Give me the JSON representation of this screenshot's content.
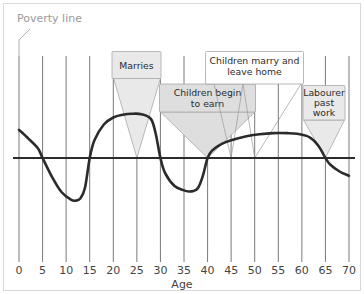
{
  "chart_data": {
    "type": "line",
    "title": "",
    "xlabel": "Age",
    "ylabel": "",
    "xlim": [
      0,
      70
    ],
    "ylim": [
      -1,
      1
    ],
    "grid": true,
    "legend_position": "none",
    "x_ticks": [
      "0",
      "5",
      "10",
      "15",
      "20",
      "25",
      "30",
      "35",
      "40",
      "45",
      "50",
      "55",
      "60",
      "65",
      "70"
    ],
    "x_tick_values": [
      0,
      5,
      10,
      15,
      20,
      25,
      30,
      35,
      40,
      45,
      50,
      55,
      60,
      65,
      70
    ],
    "reference_line": {
      "label": "Poverty line",
      "value": 0,
      "orientation": "horizontal"
    },
    "series": [
      {
        "name": "Income relative to poverty line",
        "x": [
          0,
          2,
          4,
          5,
          7,
          9,
          11,
          12,
          13,
          14,
          15,
          16,
          18,
          20,
          22,
          24,
          26,
          28,
          29,
          30,
          31,
          33,
          35,
          36,
          37,
          38,
          39,
          40,
          41,
          43,
          45,
          48,
          51,
          54,
          57,
          59,
          61,
          62,
          63,
          64,
          65,
          66,
          68,
          70
        ],
        "y": [
          0.52,
          0.36,
          0.18,
          0.0,
          -0.35,
          -0.63,
          -0.77,
          -0.79,
          -0.75,
          -0.55,
          0.0,
          0.33,
          0.62,
          0.75,
          0.8,
          0.82,
          0.81,
          0.72,
          0.45,
          0.0,
          -0.28,
          -0.52,
          -0.6,
          -0.62,
          -0.61,
          -0.55,
          -0.33,
          0.0,
          0.14,
          0.26,
          0.33,
          0.4,
          0.44,
          0.46,
          0.46,
          0.45,
          0.41,
          0.36,
          0.28,
          0.16,
          0.0,
          -0.12,
          -0.25,
          -0.33
        ]
      }
    ],
    "annotations": [
      {
        "id": "marries",
        "label": "Marries",
        "lines": [
          "Marries"
        ],
        "points_to_age": 25,
        "style": "grey-funnel"
      },
      {
        "id": "children-begin-to-earn",
        "label": "Children begin to earn",
        "lines": [
          "Children begin",
          "to earn"
        ],
        "points_to_age": 40,
        "style": "grey-funnel"
      },
      {
        "id": "children-marry-and-leave-home",
        "label": "Children marry and leave home",
        "lines": [
          "Children marry and",
          "leave home"
        ],
        "points_to_age": [
          46,
          50
        ],
        "style": "white-box"
      },
      {
        "id": "labourer-past-work",
        "label": "Labourer past work",
        "lines": [
          "Labourer",
          "past",
          "work"
        ],
        "points_to_age": 65,
        "style": "grey-funnel"
      }
    ]
  },
  "colors": {
    "curve": "#2b2b2b",
    "poverty_line": "#2b2b2b",
    "gridline": "#7a7a7a",
    "callout_fill": "#e8e8e8",
    "callout_stroke": "#a8a8a8",
    "callout_white_fill": "#ffffff",
    "text": "#444444",
    "poverty_label": "#9a9a9a",
    "frame": "#d9d9d9",
    "background": "#ffffff"
  },
  "labels": {
    "poverty_line": "Poverty line",
    "axis_title": "Age"
  }
}
